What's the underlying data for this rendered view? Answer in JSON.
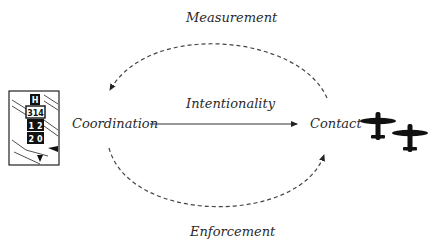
{
  "diagram": {
    "nodes": {
      "left": {
        "label": "Coordination",
        "icon": "airport-signpost-icon",
        "sign_text": [
          "H",
          "3 14",
          "1 2",
          "2 0"
        ]
      },
      "right": {
        "label": "Contact",
        "icon": "fighter-planes-icon"
      }
    },
    "edges": {
      "top": {
        "label": "Measurement",
        "from": "Contact",
        "to": "Coordination",
        "style": "dashed-arc"
      },
      "middle": {
        "label": "Intentionality",
        "from": "Coordination",
        "to": "Contact",
        "style": "solid-arrow"
      },
      "bottom": {
        "label": "Enforcement",
        "from": "Coordination",
        "to": "Contact",
        "style": "dashed-arc"
      }
    },
    "colors": {
      "line": "#333333",
      "text": "#2a2a2a",
      "background": "#ffffff"
    }
  }
}
